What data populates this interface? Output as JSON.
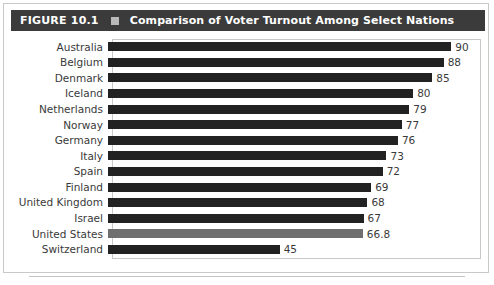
{
  "figure": {
    "number_label": "FIGURE 10.1",
    "separator_icon": "filled-square-icon",
    "title": "Comparison of Voter Turnout Among Select Nations"
  },
  "colors": {
    "header_background": "#3b3b3b",
    "header_text": "#ffffff",
    "header_square": "#b9b9b9",
    "bar_default": "#222222",
    "bar_highlight": "#6f6f6f",
    "label_text": "#3a3a3a",
    "border": "#c9c9c9",
    "page_background": "#ffffff"
  },
  "chart_data": {
    "type": "bar",
    "orientation": "horizontal",
    "title": "Comparison of Voter Turnout Among Select Nations",
    "xlabel": "",
    "ylabel": "",
    "xlim": [
      0,
      97
    ],
    "grid": false,
    "legend": null,
    "highlight_category": "United States",
    "categories": [
      "Australia",
      "Belgium",
      "Denmark",
      "Iceland",
      "Netherlands",
      "Norway",
      "Germany",
      "Italy",
      "Spain",
      "Finland",
      "United Kingdom",
      "Israel",
      "United States",
      "Switzerland"
    ],
    "values": [
      90,
      88,
      85,
      80,
      79,
      77,
      76,
      73,
      72,
      69,
      68,
      67,
      66.8,
      45
    ],
    "value_labels": [
      "90",
      "88",
      "85",
      "80",
      "79",
      "77",
      "76",
      "73",
      "72",
      "69",
      "68",
      "67",
      "66.8",
      "45"
    ]
  }
}
